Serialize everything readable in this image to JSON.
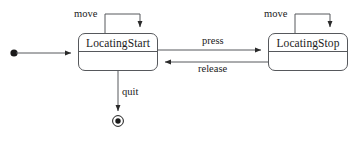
{
  "diagram": {
    "type": "uml-state-machine",
    "title": "",
    "colors": {
      "stroke": "#56585c",
      "text": "#1a1a1a",
      "background": "#ffffff"
    },
    "states": [
      {
        "id": "initial",
        "kind": "initial-pseudostate",
        "label": "",
        "x": 14,
        "y": 53
      },
      {
        "id": "locating-start",
        "kind": "state",
        "label": "LocatingStart",
        "x": 78,
        "y": 33,
        "width": 80,
        "height": 38
      },
      {
        "id": "locating-stop",
        "kind": "state",
        "label": "LocatingStop",
        "x": 268,
        "y": 33,
        "width": 80,
        "height": 38
      },
      {
        "id": "final",
        "kind": "final-state",
        "label": "",
        "x": 118,
        "y": 121
      }
    ],
    "transitions": [
      {
        "id": "t-init",
        "from": "initial",
        "to": "locating-start",
        "label": ""
      },
      {
        "id": "t-move-start",
        "from": "locating-start",
        "to": "locating-start",
        "label": "move"
      },
      {
        "id": "t-press",
        "from": "locating-start",
        "to": "locating-stop",
        "label": "press"
      },
      {
        "id": "t-release",
        "from": "locating-stop",
        "to": "locating-start",
        "label": "release"
      },
      {
        "id": "t-move-stop",
        "from": "locating-stop",
        "to": "locating-stop",
        "label": "move"
      },
      {
        "id": "t-quit",
        "from": "locating-start",
        "to": "final",
        "label": "quit"
      }
    ]
  }
}
